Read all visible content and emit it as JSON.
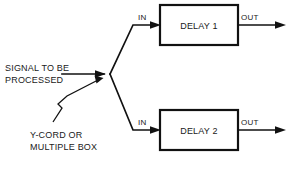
{
  "diagram": {
    "background_color": "#ffffff",
    "line_color": "#111111",
    "text_color": "#1a1a1a",
    "labels": {
      "signal_line1": "SIGNAL TO BE",
      "signal_line2": "PROCESSED",
      "annotation_line1": "Y-CORD OR",
      "annotation_line2": "MULTIPLE BOX",
      "in_top": "IN",
      "in_bottom": "IN",
      "out_top": "OUT",
      "out_bottom": "OUT"
    },
    "blocks": [
      {
        "label": "DELAY 1",
        "x": 160,
        "y": 5,
        "width": 78,
        "height": 40
      },
      {
        "label": "DELAY 2",
        "x": 160,
        "y": 110,
        "width": 78,
        "height": 40
      }
    ],
    "junction": {
      "x": 110,
      "y": 74
    },
    "caption_partial": ""
  }
}
